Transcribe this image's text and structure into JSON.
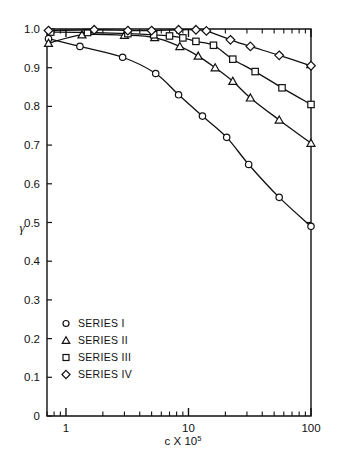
{
  "chart_data": {
    "type": "line",
    "title": "",
    "xlabel": "c X 10^5",
    "xlabel_base": "c X 10",
    "xlabel_exponent": "5",
    "ylabel": "γ",
    "xscale": "log",
    "xlim": [
      0.7,
      100
    ],
    "ylim": [
      0,
      1.0
    ],
    "xticks": [
      1,
      10,
      100
    ],
    "xticklabels": [
      "1",
      "10",
      "100"
    ],
    "yticks": [
      0,
      0.1,
      0.2,
      0.3,
      0.4,
      0.5,
      0.6,
      0.7,
      0.8,
      0.9,
      1.0
    ],
    "yticklabels": [
      "0",
      "0.1",
      "0.2",
      "0.3",
      "0.4",
      "0.5",
      "0.6",
      "0.7",
      "0.8",
      "0.9",
      "1.0"
    ],
    "grid": false,
    "legend_position": "lower-left",
    "series": [
      {
        "name": "SERIES I",
        "marker": "circle",
        "color": "#111111",
        "x": [
          0.72,
          1.3,
          2.9,
          5.4,
          8.3,
          13.0,
          20.5,
          31.0,
          55.0,
          100.0
        ],
        "y": [
          0.975,
          0.955,
          0.927,
          0.885,
          0.83,
          0.775,
          0.72,
          0.65,
          0.565,
          0.49
        ]
      },
      {
        "name": "SERIES II",
        "marker": "triangle",
        "color": "#111111",
        "x": [
          0.72,
          1.35,
          3.0,
          5.3,
          8.5,
          12.0,
          16.5,
          23.0,
          32.0,
          55.0,
          100.0
        ],
        "y": [
          0.963,
          0.985,
          0.984,
          0.978,
          0.955,
          0.93,
          0.9,
          0.865,
          0.822,
          0.765,
          0.705
        ]
      },
      {
        "name": "SERIES III",
        "marker": "square",
        "color": "#111111",
        "x": [
          0.75,
          1.5,
          3.2,
          5.2,
          7.0,
          9.0,
          11.5,
          16.0,
          23.0,
          35.0,
          58.0,
          100.0
        ],
        "y": [
          0.992,
          0.991,
          0.988,
          0.985,
          0.982,
          0.977,
          0.968,
          0.958,
          0.922,
          0.89,
          0.848,
          0.805
        ]
      },
      {
        "name": "SERIES IV",
        "marker": "diamond",
        "color": "#111111",
        "x": [
          0.72,
          1.7,
          3.2,
          5.0,
          8.3,
          11.5,
          14.0,
          22.0,
          32.0,
          55.0,
          100.0
        ],
        "y": [
          0.996,
          0.998,
          0.996,
          0.996,
          0.998,
          0.998,
          0.995,
          0.972,
          0.955,
          0.932,
          0.905
        ]
      }
    ]
  },
  "legend": {
    "items": [
      {
        "label": "SERIES I",
        "marker": "circle"
      },
      {
        "label": "SERIES II",
        "marker": "triangle"
      },
      {
        "label": "SERIES III",
        "marker": "square"
      },
      {
        "label": "SERIES IV",
        "marker": "diamond"
      }
    ]
  },
  "colors": {
    "line": "#111111",
    "axis": "#111111",
    "background": "#ffffff",
    "marker_fill": "#ffffff"
  }
}
